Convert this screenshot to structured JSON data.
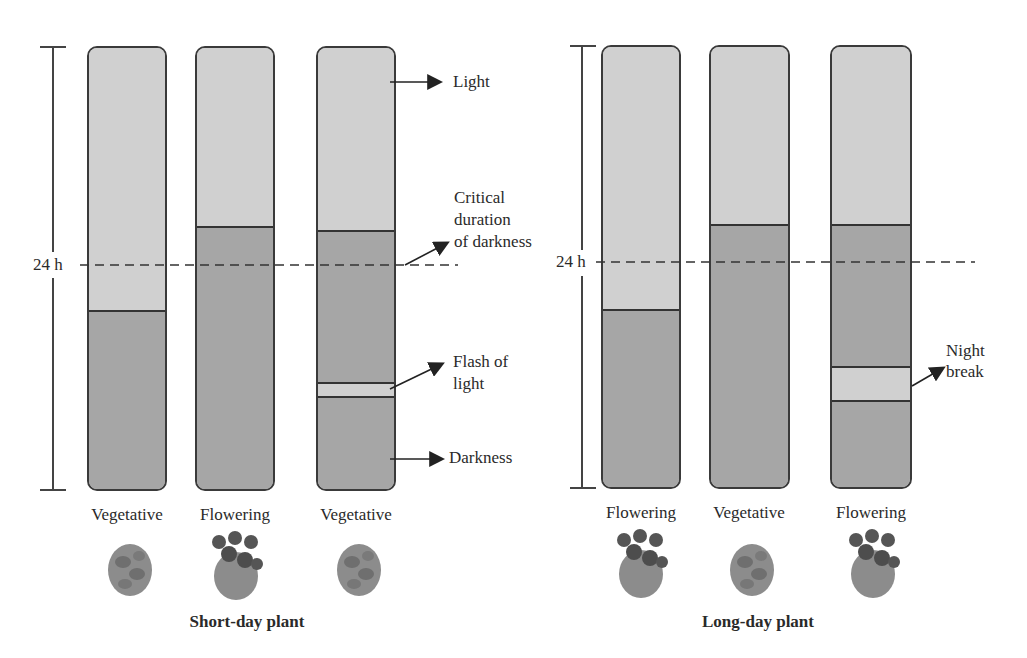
{
  "diagram": {
    "panels": [
      {
        "id": "short-day",
        "caption": "Short-day plant",
        "hours_label": "24 h",
        "bars": [
          {
            "light_fraction": 0.59,
            "break": null,
            "outcome": "Vegetative"
          },
          {
            "light_fraction": 0.4,
            "break": null,
            "outcome": "Flowering"
          },
          {
            "light_fraction": 0.41,
            "break": "flash",
            "outcome": "Vegetative"
          }
        ]
      },
      {
        "id": "long-day",
        "caption": "Long-day plant",
        "hours_label": "24 h",
        "bars": [
          {
            "light_fraction": 0.59,
            "break": null,
            "outcome": "Flowering"
          },
          {
            "light_fraction": 0.4,
            "break": null,
            "outcome": "Vegetative"
          },
          {
            "light_fraction": 0.4,
            "break": "night-break",
            "outcome": "Flowering"
          }
        ]
      }
    ],
    "annotations": {
      "light": "Light",
      "critical_line1": "Critical",
      "critical_line2": "duration",
      "critical_line3": "of darkness",
      "flash_line1": "Flash of",
      "flash_line2": "light",
      "darkness": "Darkness",
      "night_line1": "Night",
      "night_line2": "break"
    },
    "colors": {
      "light_period": "#d0d0d0",
      "dark_period": "#a6a6a6",
      "outline": "#3a3a3a"
    },
    "plant_icons": [
      "vegetative-plant-icon",
      "flowering-plant-icon"
    ]
  }
}
